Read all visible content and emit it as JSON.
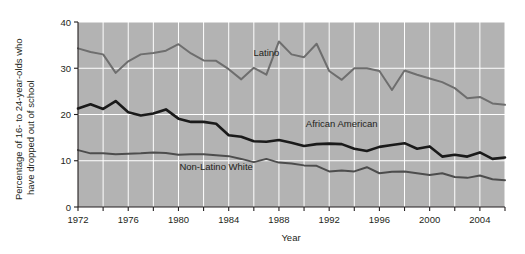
{
  "chart_data": {
    "type": "line",
    "title": "",
    "xlabel": "Year",
    "ylabel": "Percentage of 16- to  24-year-olds who have dropped out of school",
    "xlim": [
      1972,
      2006
    ],
    "ylim": [
      0,
      40
    ],
    "yticks": [
      0,
      10,
      20,
      30,
      40
    ],
    "ytick_labels": [
      "0",
      "10",
      "20",
      "30",
      "40"
    ],
    "xticks": [
      1972,
      1974,
      1976,
      1978,
      1980,
      1982,
      1984,
      1986,
      1988,
      1990,
      1992,
      1994,
      1996,
      1998,
      2000,
      2002,
      2004,
      2006
    ],
    "xtick_labels_shown": [
      "1972",
      "1976",
      "1980",
      "1984",
      "1988",
      "1992",
      "1996",
      "2000",
      "2004"
    ],
    "grid": "white gridlines on gray plot background, vertical every 2 years, horizontal every 10 units",
    "legend_position": "inline labels on plot",
    "plot_background": "#b3b3b3",
    "gridline_color": "#ffffff",
    "x": [
      1972,
      1973,
      1974,
      1975,
      1976,
      1977,
      1978,
      1979,
      1980,
      1981,
      1982,
      1983,
      1984,
      1985,
      1986,
      1987,
      1988,
      1989,
      1990,
      1991,
      1992,
      1993,
      1994,
      1995,
      1996,
      1997,
      1998,
      1999,
      2000,
      2001,
      2002,
      2003,
      2004,
      2005,
      2006
    ],
    "series": [
      {
        "name": "Latino",
        "color": "#6e6e6e",
        "label_x": 1987,
        "label_y": 32.6,
        "values": [
          34.3,
          33.5,
          33.0,
          29.0,
          31.5,
          33.0,
          33.3,
          33.8,
          35.2,
          33.2,
          31.7,
          31.6,
          29.8,
          27.6,
          30.1,
          28.6,
          35.8,
          33.0,
          32.4,
          35.3,
          29.4,
          27.5,
          30.0,
          30.0,
          29.4,
          25.3,
          29.5,
          28.6,
          27.8,
          27.0,
          25.7,
          23.5,
          23.8,
          22.4,
          22.1
        ]
      },
      {
        "name": "African American",
        "color": "#1a1a1a",
        "label_x": 1993,
        "label_y": 17.4,
        "values": [
          21.3,
          22.2,
          21.2,
          22.9,
          20.5,
          19.8,
          20.2,
          21.1,
          19.1,
          18.4,
          18.4,
          18.0,
          15.5,
          15.2,
          14.2,
          14.1,
          14.5,
          13.9,
          13.2,
          13.6,
          13.7,
          13.6,
          12.6,
          12.1,
          13.0,
          13.4,
          13.8,
          12.6,
          13.1,
          10.9,
          11.3,
          10.9,
          11.8,
          10.4,
          10.7
        ]
      },
      {
        "name": "Non-Latino White",
        "color": "#4d4d4d",
        "label_x": 1983,
        "label_y": 7.9,
        "values": [
          12.3,
          11.6,
          11.6,
          11.4,
          11.5,
          11.6,
          11.8,
          11.7,
          11.3,
          11.4,
          11.4,
          11.2,
          11.0,
          10.4,
          9.7,
          10.4,
          9.6,
          9.4,
          9.0,
          8.9,
          7.7,
          7.9,
          7.7,
          8.6,
          7.3,
          7.6,
          7.7,
          7.3,
          6.9,
          7.3,
          6.5,
          6.3,
          6.8,
          6.0,
          5.8
        ]
      }
    ]
  }
}
